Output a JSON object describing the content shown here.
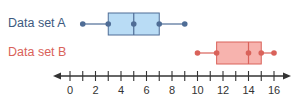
{
  "chart_data": {
    "type": "boxplot",
    "title": "",
    "xlabel": "",
    "ylabel": "",
    "xlim": [
      0,
      16
    ],
    "axis": {
      "ticks": [
        0,
        1,
        2,
        3,
        4,
        5,
        6,
        7,
        8,
        9,
        10,
        11,
        12,
        13,
        14,
        15,
        16
      ],
      "tick_labels": [
        "0",
        "2",
        "4",
        "6",
        "8",
        "10",
        "12",
        "14",
        "16"
      ],
      "labeled_ticks": [
        0,
        2,
        4,
        6,
        8,
        10,
        12,
        14,
        16
      ],
      "arrows": "both"
    },
    "series": [
      {
        "name": "Data set A",
        "min": 1,
        "q1": 3,
        "median": 5,
        "q3": 7,
        "max": 9,
        "fill_color": "#b9dcf5",
        "stroke_color": "#4f6d96",
        "label_color": "#3d5a80"
      },
      {
        "name": "Data set B",
        "min": 10,
        "q1": 11.5,
        "median": 14,
        "q3": 15,
        "max": 16,
        "fill_color": "#f7b3ae",
        "stroke_color": "#d9625a",
        "label_color": "#d9625a"
      }
    ],
    "grid": false,
    "legend": "inline labels left of each box"
  },
  "labels": {
    "a": "Data set A",
    "b": "Data set B"
  }
}
